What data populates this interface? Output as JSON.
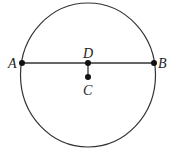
{
  "diagram": {
    "type": "geometry",
    "circle": {
      "cx": 88,
      "cy": 75,
      "rx": 67.5,
      "ry": 72
    },
    "points": [
      {
        "name": "A",
        "x": 22,
        "y": 63,
        "label_x": 8,
        "label_y": 68
      },
      {
        "name": "B",
        "x": 154,
        "y": 63,
        "label_x": 158,
        "label_y": 68
      },
      {
        "name": "D",
        "x": 88,
        "y": 63,
        "label_x": 83,
        "label_y": 58
      },
      {
        "name": "C",
        "x": 88,
        "y": 77,
        "label_x": 83,
        "label_y": 95
      }
    ],
    "segments": [
      {
        "from": "A",
        "to": "B"
      },
      {
        "from": "D",
        "to": "C"
      }
    ],
    "colors": {
      "stroke": "#333333",
      "point": "#111111",
      "background": "#ffffff"
    }
  }
}
